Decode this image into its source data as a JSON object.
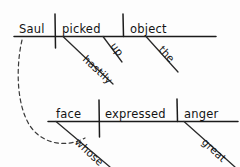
{
  "diagram": {
    "type": "reed-kellogg-sentence-diagram",
    "sentence": "Saul picked up hastily the object whose face expressed great anger",
    "ink_color": "#141414",
    "background_color": "#fdfdfd",
    "clauses": [
      {
        "name": "main-clause",
        "baseline_y": 36,
        "words": [
          {
            "slot": "subject",
            "text": "Saul"
          },
          {
            "slot": "verb",
            "text": "picked"
          },
          {
            "slot": "direct-object",
            "text": "object"
          }
        ],
        "modifiers": [
          {
            "slot": "verb-particle",
            "text": "up",
            "attaches_to": "picked"
          },
          {
            "slot": "adverb",
            "text": "hastily",
            "attaches_to": "picked"
          },
          {
            "slot": "article",
            "text": "the",
            "attaches_to": "object"
          }
        ]
      },
      {
        "name": "relative-clause",
        "baseline_y": 121,
        "words": [
          {
            "slot": "subject",
            "text": "face"
          },
          {
            "slot": "verb",
            "text": "expressed"
          },
          {
            "slot": "direct-object",
            "text": "anger"
          }
        ],
        "modifiers": [
          {
            "slot": "relative-pronoun",
            "text": "whose",
            "attaches_to": "face"
          },
          {
            "slot": "adjective",
            "text": "great",
            "attaches_to": "anger"
          }
        ]
      }
    ],
    "connector": {
      "name": "relative-clause-connector",
      "style": "dashed-curve",
      "from_word": "Saul",
      "to_word": "whose"
    }
  }
}
